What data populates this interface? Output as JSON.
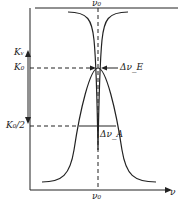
{
  "diagram": {
    "title": "",
    "labels": {
      "v0_top": "ν₀",
      "v0_bottom": "ν₀",
      "x_axis": "ν",
      "kv": "Kᵥ",
      "k0": "K₀",
      "k0_half": "K₀/2",
      "delta_ve": "Δν_E",
      "delta_va": "Δν_A"
    },
    "colors": {
      "line": "#222222",
      "background": "#ffffff"
    }
  }
}
